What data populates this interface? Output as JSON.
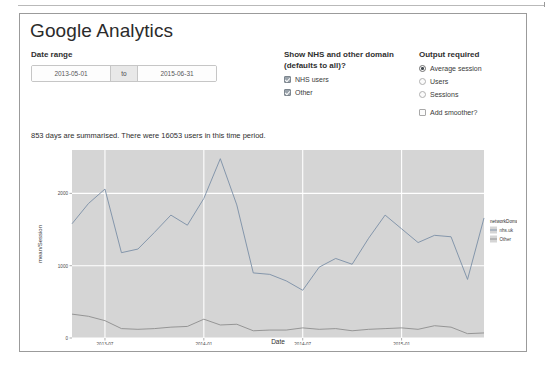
{
  "app": {
    "title": "Google Analytics"
  },
  "date_range": {
    "heading": "Date range",
    "start_value": "2013-05-01",
    "start_placeholder": "yyyy-mm-dd",
    "separator_label": "to",
    "end_value": "2015-06-31",
    "end_placeholder": "yyyy-mm-dd"
  },
  "domain_filter": {
    "heading_line1": "Show NHS and other domain",
    "heading_line2": "(defaults to all)?",
    "options": [
      {
        "label": "NHS users",
        "checked": true
      },
      {
        "label": "Other",
        "checked": true
      }
    ]
  },
  "output": {
    "heading": "Output required",
    "options": [
      {
        "label": "Average session",
        "selected": true
      },
      {
        "label": "Users",
        "selected": false
      },
      {
        "label": "Sessions",
        "selected": false
      }
    ],
    "smoother": {
      "label": "Add smoother?",
      "checked": false
    }
  },
  "summary": {
    "text": "853 days are summarised. There were 16053 users in this time period."
  },
  "chart_data": {
    "type": "line",
    "title": "",
    "xlabel": "Date",
    "ylabel": "mean/Session",
    "xtick_labels": [
      "2013-07",
      "2014-01",
      "2014-07",
      "2015-01"
    ],
    "ytick_labels": [
      "0",
      "1000",
      "2000"
    ],
    "ylim": [
      0,
      2600
    ],
    "grid": true,
    "grid_color": "#ffffff",
    "panel_color": "#d5d5d5",
    "legend": {
      "title": "networkDomain",
      "position": "right",
      "entries": [
        {
          "label": "nhs.uk",
          "color": "#7b8fa6"
        },
        {
          "label": "Other",
          "color": "#8d8d8d"
        }
      ]
    },
    "series": [
      {
        "name": "nhs.uk",
        "color": "#7b8fa6",
        "x": [
          "2013-05",
          "2013-06",
          "2013-07",
          "2013-08",
          "2013-09",
          "2013-10",
          "2013-11",
          "2013-12",
          "2014-01",
          "2014-02",
          "2014-03",
          "2014-04",
          "2014-05",
          "2014-06",
          "2014-07",
          "2014-08",
          "2014-09",
          "2014-10",
          "2014-11",
          "2014-12",
          "2015-01",
          "2015-02",
          "2015-03",
          "2015-04",
          "2015-05",
          "2015-06"
        ],
        "values": [
          1580,
          1860,
          2060,
          1180,
          1230,
          1460,
          1700,
          1560,
          1930,
          2480,
          1840,
          900,
          880,
          790,
          660,
          980,
          1100,
          1020,
          1380,
          1700,
          1510,
          1320,
          1420,
          1400,
          810,
          1660
        ]
      },
      {
        "name": "Other",
        "color": "#8d8d8d",
        "x": [
          "2013-05",
          "2013-06",
          "2013-07",
          "2013-08",
          "2013-09",
          "2013-10",
          "2013-11",
          "2013-12",
          "2014-01",
          "2014-02",
          "2014-03",
          "2014-04",
          "2014-05",
          "2014-06",
          "2014-07",
          "2014-08",
          "2014-09",
          "2014-10",
          "2014-11",
          "2014-12",
          "2015-01",
          "2015-02",
          "2015-03",
          "2015-04",
          "2015-05",
          "2015-06"
        ],
        "values": [
          330,
          300,
          240,
          130,
          120,
          130,
          150,
          160,
          260,
          180,
          190,
          100,
          110,
          110,
          140,
          120,
          130,
          100,
          120,
          130,
          140,
          120,
          170,
          150,
          60,
          70
        ]
      }
    ]
  }
}
